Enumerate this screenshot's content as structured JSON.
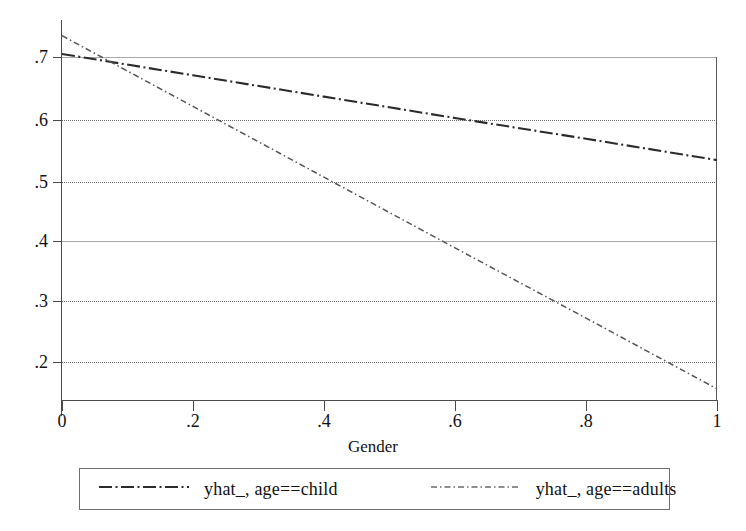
{
  "chart_data": {
    "type": "line",
    "title": "",
    "subtitle": "",
    "xlabel": "Gender",
    "ylabel": "",
    "xlim": [
      0,
      1
    ],
    "ylim": [
      0.145,
      0.745
    ],
    "xticks": [
      "0",
      ".2",
      ".4",
      ".6",
      ".8",
      "1"
    ],
    "xtick_values": [
      0,
      0.2,
      0.4,
      0.6,
      0.8,
      1
    ],
    "yticks": [
      ".7",
      ".6",
      ".5",
      ".4",
      ".3",
      ".2"
    ],
    "ytick_values": [
      0.7,
      0.6,
      0.5,
      0.4,
      0.3,
      0.2
    ],
    "grid": true,
    "grid_style": "horizontal dotted gridlines at .6 .5 .3 .2; solid gridlines at .7 and .4",
    "legend_position": "below-plot",
    "series": [
      {
        "name": "yhat_, age==child",
        "style": "longdash-dot",
        "color": "#2b2b2b",
        "x": [
          0,
          0.2,
          0.4,
          0.6,
          0.8,
          1
        ],
        "values": [
          0.705,
          0.67,
          0.635,
          0.6,
          0.566,
          0.531
        ]
      },
      {
        "name": "yhat_, age==adults",
        "style": "dash-dot-fine",
        "color": "#555555",
        "x": [
          0,
          0.2,
          0.4,
          0.6,
          0.8,
          1
        ],
        "values": [
          0.735,
          0.619,
          0.503,
          0.387,
          0.272,
          0.156
        ]
      }
    ],
    "annotations": [
      "series cross at approximately x = 0.05, y = 0.70"
    ]
  },
  "axis": {
    "x_title": "Gender"
  },
  "legend": {
    "entries": [
      {
        "label": "yhat_, age==child"
      },
      {
        "label": "yhat_, age==adults"
      }
    ]
  }
}
